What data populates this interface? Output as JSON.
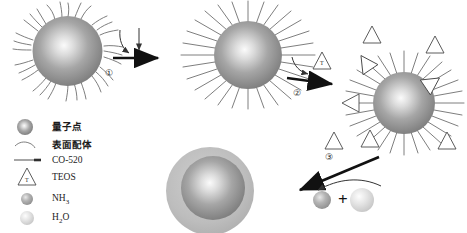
{
  "figure": {
    "background": "#ffffff"
  },
  "colors": {
    "qd_core_center": "#f2f2f2",
    "qd_core_mid": "#a9a9a9",
    "qd_core_edge": "#7d7d7d",
    "silica_shell": "#b9b9b9",
    "ligand_stroke": "#6f6f6f",
    "co520_stroke": "#5e5e5e",
    "arrow_fill": "#111111",
    "triangle_stroke": "#4a4a4a",
    "nh3_sphere": "#9a9a9a",
    "h2o_sphere": "#d0d0d0",
    "text": "#1c1c1c"
  },
  "steps": [
    {
      "id": "step-1",
      "label": "①"
    },
    {
      "id": "step-2",
      "label": "②"
    },
    {
      "id": "step-3",
      "label": "③"
    }
  ],
  "structures": {
    "qd_with_surface_ligands": {
      "name": "quantum-dot-with-surface-ligands"
    },
    "qd_with_co520": {
      "name": "quantum-dot-with-co520"
    },
    "qd_with_teos": {
      "name": "quantum-dot-with-teos"
    },
    "silica_coated_qd": {
      "name": "silica-coated-quantum-dot"
    }
  },
  "reagents": {
    "teos_glyph": "T",
    "plus": "+",
    "nh3": "NH",
    "nh3_sub": "3",
    "h2o_h": "H",
    "h2o_sub": "2",
    "h2o_o": "O"
  },
  "legend": {
    "items": [
      {
        "icon": "quantum-dot-sphere-icon",
        "label": "量子点",
        "lang": "cn"
      },
      {
        "icon": "surface-ligand-curve-icon",
        "label": "表面配体",
        "lang": "cn"
      },
      {
        "icon": "co520-line-icon",
        "label": "CO-520",
        "lang": "en"
      },
      {
        "icon": "teos-triangle-icon",
        "label": "TEOS",
        "lang": "en"
      },
      {
        "icon": "nh3-sphere-icon",
        "label": "NH3",
        "lang": "en",
        "base": "NH",
        "sub": "3"
      },
      {
        "icon": "h2o-sphere-icon",
        "label": "H2O",
        "lang": "en",
        "base": "H",
        "sub": "2",
        "tail": "O"
      }
    ]
  }
}
